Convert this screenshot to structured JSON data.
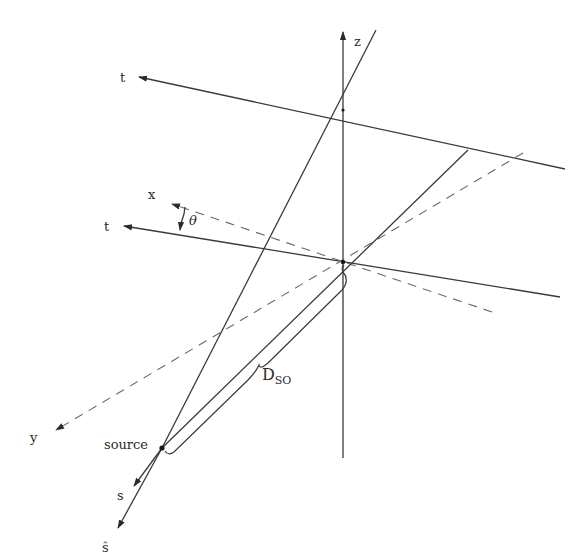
{
  "figure": {
    "type": "geometry-diagram",
    "labels": {
      "z_axis": "z",
      "t_axis_top": "t",
      "t_axis_mid": "t",
      "x_axis": "x",
      "y_axis": "y",
      "angle": "θ",
      "source": "source",
      "s_axis": "s",
      "s_hat_axis": "ŝ",
      "distance_main": "D",
      "distance_sub": "SO"
    },
    "colors": {
      "line": "#3a3a3a",
      "dashed": "#6a6a6a",
      "text": "#2a2a2a",
      "background": "#ffffff"
    },
    "points": {
      "origin": [
        343,
        262
      ],
      "source": [
        162,
        448
      ],
      "z_top": [
        343,
        30
      ]
    }
  }
}
